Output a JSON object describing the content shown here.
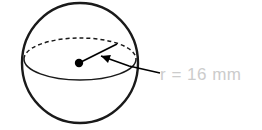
{
  "figure": {
    "kind": "sphere-radius-diagram",
    "background_color": "#ffffff",
    "canvas": {
      "width": 262,
      "height": 130
    },
    "label": {
      "text": "r = 16 mm",
      "variable": "r",
      "value": 16,
      "unit": "mm",
      "color": "#cccccc",
      "x": 160,
      "y": 80,
      "font_size": 17
    },
    "sphere": {
      "center_x": 80,
      "center_y": 63,
      "radius_x": 58,
      "radius_y": 60,
      "stroke_color": "#1a1a1a",
      "stroke_width": 2.4,
      "fill_color": "#ffffff"
    },
    "equator": {
      "center_x": 80,
      "center_y": 59,
      "radius_x": 56,
      "radius_y": 21,
      "front_style": "solid",
      "back_style": "dashed",
      "dash_pattern": "4 3",
      "stroke_color": "#1a1a1a",
      "stroke_width": 1.5
    },
    "center_point": {
      "x": 79,
      "y": 63,
      "radius": 4.2,
      "color": "#000000"
    },
    "radius_arrow": {
      "tail_x": 160,
      "tail_y": 73,
      "head_x": 101,
      "head_y": 56,
      "elbow_x": 129,
      "elbow_y": 66,
      "stroke_color": "#000000",
      "stroke_width": 1.6,
      "head_size": 9
    },
    "leader_stub": {
      "start_x": 81,
      "start_y": 62,
      "end_x": 117,
      "end_y": 44,
      "stroke_color": "#000000",
      "stroke_width": 1.6
    }
  }
}
